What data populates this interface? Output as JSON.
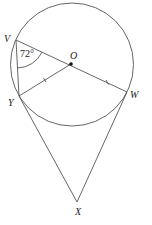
{
  "figure": {
    "points": {
      "V": "V",
      "O": "O",
      "Y": "Y",
      "W": "W",
      "X": "X"
    },
    "angle_label": "72°",
    "angle_at": "V",
    "angle_between": [
      "VO",
      "VY"
    ],
    "equal_segments": [
      "OY",
      "OW"
    ],
    "colors": {
      "line": "#555555",
      "text": "#222222",
      "background": "#ffffff"
    }
  }
}
